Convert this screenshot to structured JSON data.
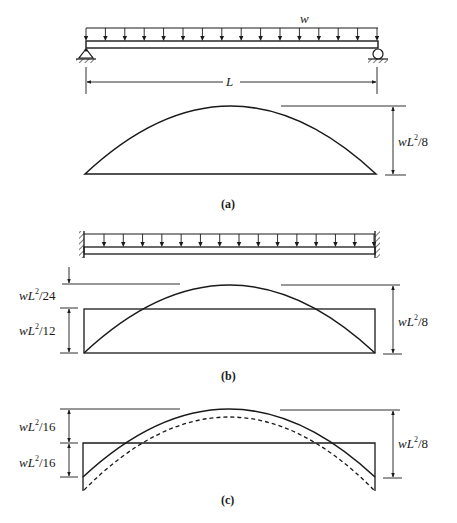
{
  "figure": {
    "panels": [
      {
        "id": "a",
        "caption": "(a)",
        "beam_type": "simply-supported",
        "load_label": "w",
        "span_label": "L",
        "supports": [
          "pin-icon",
          "roller-icon"
        ],
        "moment_diagram": {
          "shape": "parabola",
          "dimension_label_right": {
            "base": "wL",
            "exp": "2",
            "rest": "/8"
          }
        }
      },
      {
        "id": "b",
        "caption": "(b)",
        "beam_type": "fixed-fixed",
        "supports": [
          "fixed-wall-icon",
          "fixed-wall-icon"
        ],
        "moment_diagram": {
          "shape": "parabola + rectangle",
          "dimension_label_left_top": {
            "base": "wL",
            "exp": "2",
            "rest": "/24"
          },
          "dimension_label_left_bottom": {
            "base": "wL",
            "exp": "2",
            "rest": "/12"
          },
          "dimension_label_right": {
            "base": "wL",
            "exp": "2",
            "rest": "/8"
          }
        }
      },
      {
        "id": "c",
        "caption": "(c)",
        "moment_diagram": {
          "shape": "parabola + rectangle + dashed parabola",
          "dimension_label_left_top": {
            "base": "wL",
            "exp": "2",
            "rest": "/16"
          },
          "dimension_label_left_bottom": {
            "base": "wL",
            "exp": "2",
            "rest": "/16"
          },
          "dimension_label_right": {
            "base": "wL",
            "exp": "2",
            "rest": "/8"
          }
        }
      }
    ],
    "colors": {
      "ink": "#1a1a1a",
      "background": "#ffffff"
    }
  }
}
